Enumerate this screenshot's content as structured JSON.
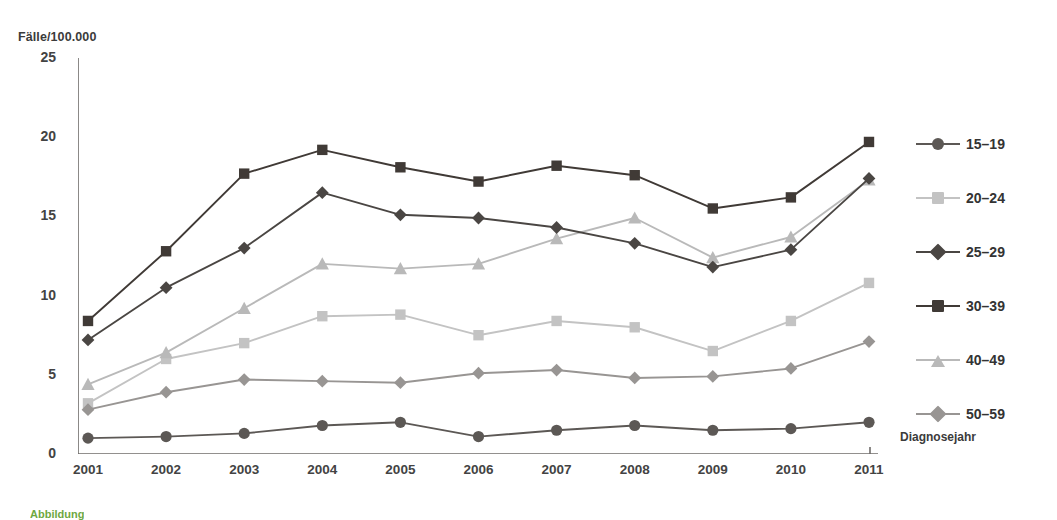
{
  "chart_data": {
    "type": "line",
    "title": "",
    "xlabel": "Diagnosejahr",
    "ylabel": "Fälle/100.000",
    "xlim": [
      2001,
      2011
    ],
    "ylim": [
      0,
      25
    ],
    "yticks": [
      0,
      5,
      10,
      15,
      20,
      25
    ],
    "grid": false,
    "legend_position": "right",
    "categories": [
      "2001",
      "2002",
      "2003",
      "2004",
      "2005",
      "2006",
      "2007",
      "2008",
      "2009",
      "2010",
      "2011"
    ],
    "series": [
      {
        "name": "15–19",
        "marker": "circle",
        "color": "#5c5855",
        "values": [
          1.0,
          1.1,
          1.3,
          1.8,
          2.0,
          1.1,
          1.5,
          1.8,
          1.5,
          1.6,
          2.0
        ]
      },
      {
        "name": "20–24",
        "marker": "square",
        "color": "#c3c3c3",
        "values": [
          3.2,
          6.0,
          7.0,
          8.7,
          8.8,
          7.5,
          8.4,
          8.0,
          6.5,
          8.4,
          10.8
        ]
      },
      {
        "name": "25–29",
        "marker": "diamond",
        "color": "#4a4643",
        "values": [
          7.2,
          10.5,
          13.0,
          16.5,
          15.1,
          14.9,
          14.3,
          13.3,
          11.8,
          12.9,
          17.4
        ]
      },
      {
        "name": "30–39",
        "marker": "square",
        "color": "#403a36",
        "values": [
          8.4,
          12.8,
          17.7,
          19.2,
          18.1,
          17.2,
          18.2,
          17.6,
          15.5,
          16.2,
          19.7
        ]
      },
      {
        "name": "40–49",
        "marker": "triangle",
        "color": "#b9b9b9",
        "values": [
          4.4,
          6.4,
          9.2,
          12.0,
          11.7,
          12.0,
          13.6,
          14.9,
          12.4,
          13.7,
          17.3
        ]
      },
      {
        "name": "50–59",
        "marker": "diamond",
        "color": "#989593",
        "values": [
          2.8,
          3.9,
          4.7,
          4.6,
          4.5,
          5.1,
          5.3,
          4.8,
          4.9,
          5.4,
          7.1
        ]
      }
    ]
  },
  "axis": {
    "y_label_text": "Fälle/100.000",
    "x_label_text": "Diagnosejahr",
    "y_tick_labels": [
      "0",
      "5",
      "10",
      "15",
      "20",
      "25"
    ],
    "x_tick_labels": [
      "2001",
      "2002",
      "2003",
      "2004",
      "2005",
      "2006",
      "2007",
      "2008",
      "2009",
      "2010",
      "2011"
    ]
  },
  "legend": {
    "items": [
      {
        "label": "15–19"
      },
      {
        "label": "20–24"
      },
      {
        "label": "25–29"
      },
      {
        "label": "30–39"
      },
      {
        "label": "40–49"
      },
      {
        "label": "50–59"
      }
    ]
  },
  "caption": {
    "text": "Abbildung"
  },
  "colors": {
    "axis": "#6e6b69",
    "text": "#3a3a3a",
    "background": "#ffffff"
  }
}
